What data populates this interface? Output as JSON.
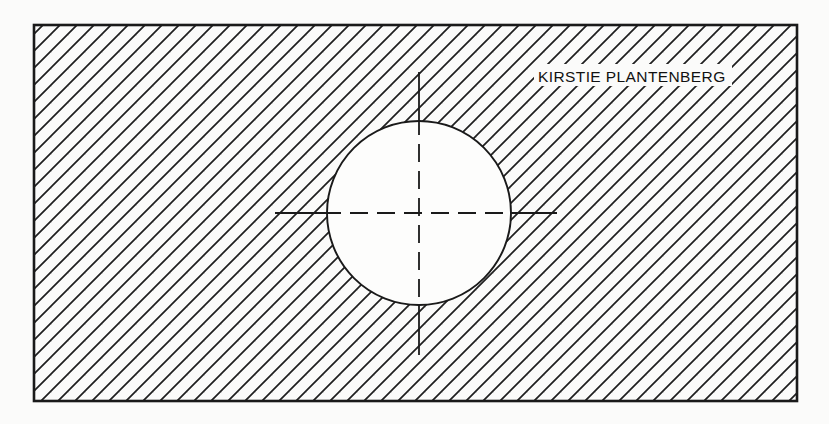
{
  "drawing": {
    "title": "Sectioned rectangular block with through hole",
    "type": "engineering-section-view",
    "background_color": "#fbfbfa",
    "line_color": "#1a1a1a",
    "canvas": {
      "width": 829,
      "height": 424
    },
    "outline": {
      "name": "part-outline-rectangle",
      "x": 34,
      "y": 25,
      "width": 763,
      "height": 376,
      "stroke_width": 2.6
    },
    "hole": {
      "name": "through-hole-circle",
      "center_x": 419,
      "center_y": 213,
      "radius": 92,
      "stroke_width": 1.9,
      "fill": "#fdfdfc"
    },
    "section_hatch": {
      "name": "section-hatching",
      "angle_degrees": 45,
      "direction": "lower-left-to-upper-right",
      "spacing_px": 12,
      "stroke_width": 1.7,
      "color": "#1f1f1f"
    },
    "centerlines": {
      "horizontal": {
        "name": "horizontal-centerline",
        "x_start": 275,
        "x_end": 557,
        "y": 213,
        "stroke_width": 1.8,
        "inner_dash": "18 9"
      },
      "vertical": {
        "name": "vertical-centerline",
        "y_start": 72,
        "y_end": 355,
        "x": 419,
        "stroke_width": 1.8,
        "inner_dash": "18 9"
      }
    },
    "annotations": [
      {
        "name": "author-name-label",
        "text": "KIRSTIE PLANTENBERG",
        "x": 538,
        "y": 82,
        "font_size": 15.5,
        "color": "#111111"
      }
    ]
  }
}
